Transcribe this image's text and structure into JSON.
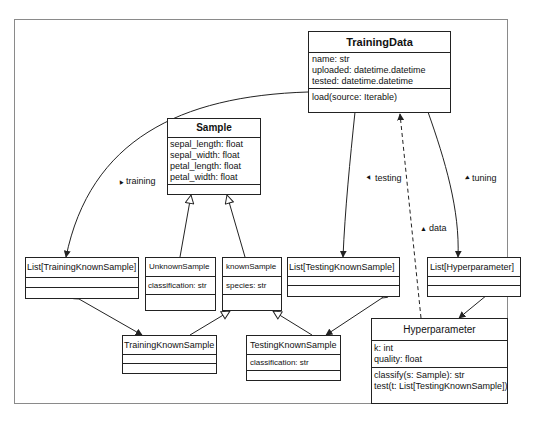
{
  "diagram": {
    "type": "UML class diagram",
    "classes": {
      "training_data": {
        "name": "TrainingData",
        "attributes": [
          "name: str",
          "uploaded: datetime.datetime",
          "tested: datetime.datetime"
        ],
        "methods": [
          "load(source: Iterable)"
        ]
      },
      "sample": {
        "name": "Sample",
        "attributes": [
          "sepal_length: float",
          "sepal_width: float",
          "petal_length: float",
          "petal_width: float"
        ],
        "methods": []
      },
      "list_training": {
        "name": "List[TrainingKnownSample]",
        "attributes": [],
        "methods": []
      },
      "unknown_sample": {
        "name": "UnknownSample",
        "attributes": [
          "classification: str"
        ],
        "methods": []
      },
      "known_sample": {
        "name": "knownSample",
        "attributes": [
          "species: str"
        ],
        "methods": []
      },
      "list_testing": {
        "name": "List[TestingKnownSample]",
        "attributes": [],
        "methods": []
      },
      "list_hyper": {
        "name": "List[Hyperparameter]",
        "attributes": [],
        "methods": []
      },
      "training_known": {
        "name": "TrainingKnownSample",
        "attributes": [],
        "methods": []
      },
      "testing_known": {
        "name": "TestingKnownSample",
        "attributes": [
          "classification: str"
        ],
        "methods": []
      },
      "hyperparameter": {
        "name": "Hyperparameter",
        "attributes": [
          "k: int",
          "quality: float"
        ],
        "methods": [
          "classify(s: Sample): str",
          "test(t: List[TestingKnownSample])"
        ]
      }
    },
    "labels": {
      "training": "training",
      "testing": "testing",
      "tuning": "tuning",
      "data": "data"
    },
    "label_marker": "▲"
  }
}
